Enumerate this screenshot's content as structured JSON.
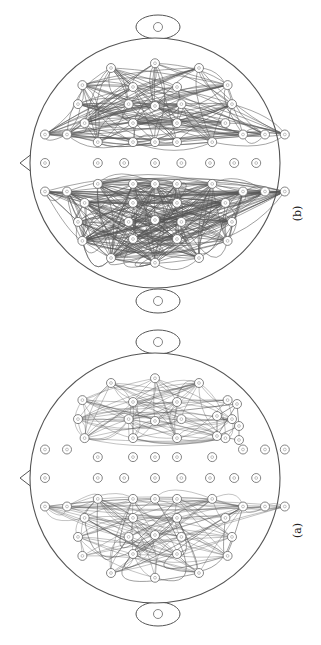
{
  "figure": {
    "panels": [
      {
        "id": "b",
        "caption": "(b)",
        "center": [
          155,
          163
        ],
        "radius": 125,
        "ear_top": [
          158,
          27
        ],
        "ear_bottom": [
          158,
          301
        ],
        "nose": [
          [
            33,
            153
          ],
          [
            20,
            163
          ],
          [
            33,
            173
          ]
        ],
        "caption_pos": [
          297,
          215
        ],
        "edge_density": "dense"
      },
      {
        "id": "a",
        "caption": "(a)",
        "center": [
          155,
          478
        ],
        "radius": 125,
        "ear_top": [
          158,
          342
        ],
        "ear_bottom": [
          158,
          614
        ],
        "nose": [
          [
            33,
            468
          ],
          [
            20,
            478
          ],
          [
            33,
            488
          ]
        ],
        "caption_pos": [
          297,
          532
        ],
        "edge_density": "moderate"
      }
    ],
    "line_color": "#555555",
    "node_stroke": "#666666"
  }
}
